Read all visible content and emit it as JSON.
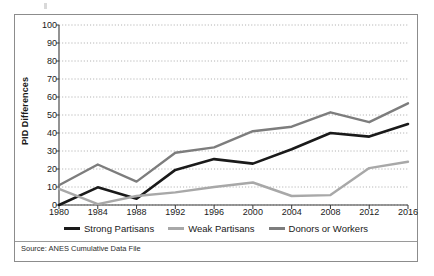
{
  "figure": {
    "source_note": "Source: ANES Cumulative Data File"
  },
  "chart_data": {
    "type": "line",
    "title": "",
    "subtitle": "",
    "xlabel": "",
    "ylabel": "PID Differences",
    "x": [
      1980,
      1984,
      1988,
      1992,
      1996,
      2000,
      2004,
      2008,
      2012,
      2016
    ],
    "xtick_labels": [
      "1980",
      "1984",
      "1988",
      "1992",
      "1996",
      "2000",
      "2004",
      "2008",
      "2012",
      "2016"
    ],
    "ytick_labels": [
      "0",
      "10",
      "20",
      "30",
      "40",
      "50",
      "60",
      "70",
      "80",
      "90",
      "100"
    ],
    "yticks": [
      0,
      10,
      20,
      30,
      40,
      50,
      60,
      70,
      80,
      90,
      100
    ],
    "ylim": [
      0,
      100
    ],
    "grid": "horizontal-dotted",
    "legend_position": "bottom-center",
    "series": [
      {
        "name": "Strong Partisans",
        "color": "#1a1a1a",
        "width": 2.6,
        "values": [
          0,
          9.8,
          3.5,
          19.5,
          25.5,
          23,
          31,
          40,
          38,
          45
        ]
      },
      {
        "name": "Weak Partisans",
        "color": "#a8a8a8",
        "width": 2.4,
        "values": [
          9,
          0.5,
          5,
          7,
          10,
          12.5,
          5,
          5.5,
          20.5,
          24
        ]
      },
      {
        "name": "Donors or Workers",
        "color": "#7d7d7d",
        "width": 2.4,
        "values": [
          11,
          22.5,
          13,
          29,
          32,
          41,
          43.5,
          51.5,
          46,
          56.5
        ]
      }
    ]
  }
}
